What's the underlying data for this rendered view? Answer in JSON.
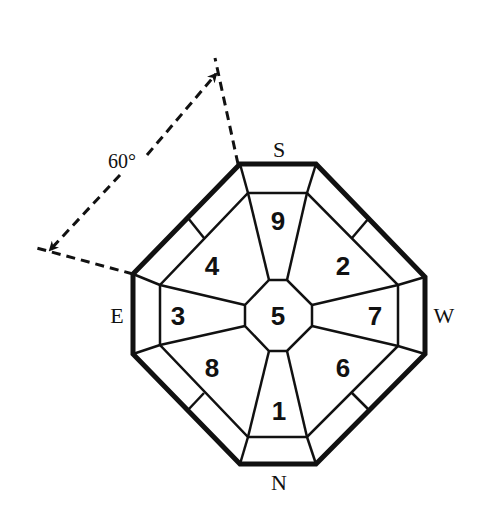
{
  "diagram": {
    "type": "octagonal-bagua-plan",
    "angle_annotation": "60°",
    "directions": {
      "top": "S",
      "bottom": "N",
      "left": "E",
      "right": "W"
    },
    "sectors": {
      "center": "5",
      "top": "9",
      "top_right": "2",
      "right": "7",
      "bottom_right": "6",
      "bottom": "1",
      "bottom_left": "8",
      "left": "3",
      "top_left": "4"
    },
    "colors": {
      "line": "#111111",
      "background": "#ffffff"
    }
  }
}
